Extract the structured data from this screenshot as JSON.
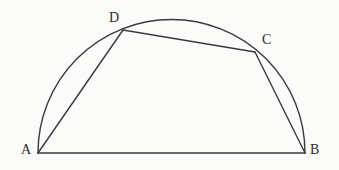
{
  "figure": {
    "background_color": "#fbfbfa",
    "stroke_color": "#3a3a3a",
    "stroke_width": 1.4,
    "label_color": "#2b2b2b",
    "width": 339,
    "height": 170
  },
  "labels": {
    "a": "A",
    "b": "B",
    "c": "C",
    "d": "D"
  },
  "chart_data": {
    "type": "diagram",
    "points": [
      {
        "name": "A",
        "x": 38,
        "y": 153,
        "label_x": 25,
        "label_y": 152
      },
      {
        "name": "B",
        "x": 305,
        "y": 153,
        "label_x": 314,
        "label_y": 152
      },
      {
        "name": "C",
        "x": 255,
        "y": 52,
        "label_x": 266,
        "label_y": 42
      },
      {
        "name": "D",
        "x": 123,
        "y": 30,
        "label_x": 113,
        "label_y": 20
      }
    ],
    "arc": {
      "name": "semicircle",
      "center_x": 171.5,
      "center_y": 153,
      "radius": 133.5,
      "start_point": "A",
      "end_point": "B",
      "apex_x": 171.5,
      "apex_y": 19.5,
      "direction": "upper half"
    },
    "segments": [
      {
        "name": "AB",
        "from": "A",
        "to": "B",
        "kind": "diameter"
      },
      {
        "name": "AD",
        "from": "A",
        "to": "D",
        "kind": "chord"
      },
      {
        "name": "DC",
        "from": "D",
        "to": "C",
        "kind": "chord"
      },
      {
        "name": "CB",
        "from": "C",
        "to": "B",
        "kind": "chord"
      }
    ],
    "xlabel": "",
    "ylabel": "",
    "grid": false,
    "legend": "none"
  }
}
